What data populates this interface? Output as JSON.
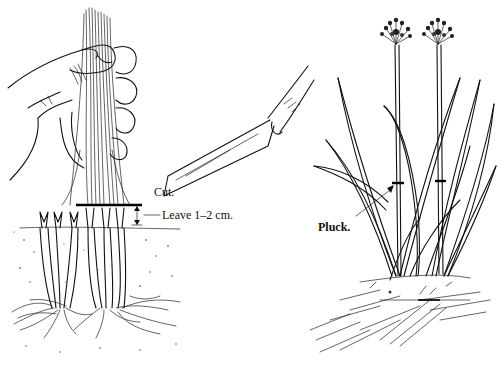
{
  "figure": {
    "left_panel": {
      "title": "cutting",
      "labels": {
        "cut": "Cut.",
        "leave": "Leave 1–2 cm."
      }
    },
    "right_panel": {
      "title": "plucking",
      "labels": {
        "pluck": "Pluck."
      }
    },
    "colors": {
      "ink": "#111111",
      "background": "#ffffff"
    }
  }
}
